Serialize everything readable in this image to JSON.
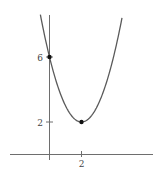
{
  "chart_data": {
    "type": "line",
    "title": "",
    "xlabel": "",
    "ylabel": "",
    "equation": "y = (x - 2)^2 + 2",
    "x_ticks": [
      2
    ],
    "x_tick_labels": [
      "2"
    ],
    "y_ticks": [
      2,
      6
    ],
    "y_tick_labels": [
      "2",
      "6"
    ],
    "xlim": [
      -2.4,
      6.5
    ],
    "ylim": [
      -0.4,
      8.6
    ],
    "grid": false,
    "legend": null,
    "series": [
      {
        "name": "parabola",
        "x": [
          -0.57,
          0,
          0.5,
          1,
          1.5,
          2,
          2.5,
          3,
          3.5,
          4,
          4.57
        ],
        "values": [
          8.6,
          6,
          4.25,
          3,
          2.25,
          2,
          2.25,
          3,
          4.25,
          6,
          8.6
        ]
      }
    ],
    "points": [
      {
        "label": "y-intercept",
        "x": 0,
        "y": 6
      },
      {
        "label": "vertex",
        "x": 2,
        "y": 2
      }
    ],
    "colors": {
      "curve": "#5a5a5a",
      "axes": "#6e6e6e",
      "points": "#111111"
    }
  },
  "labels": {
    "x_tick_2": "2",
    "y_tick_6": "6",
    "y_tick_2": "2"
  }
}
